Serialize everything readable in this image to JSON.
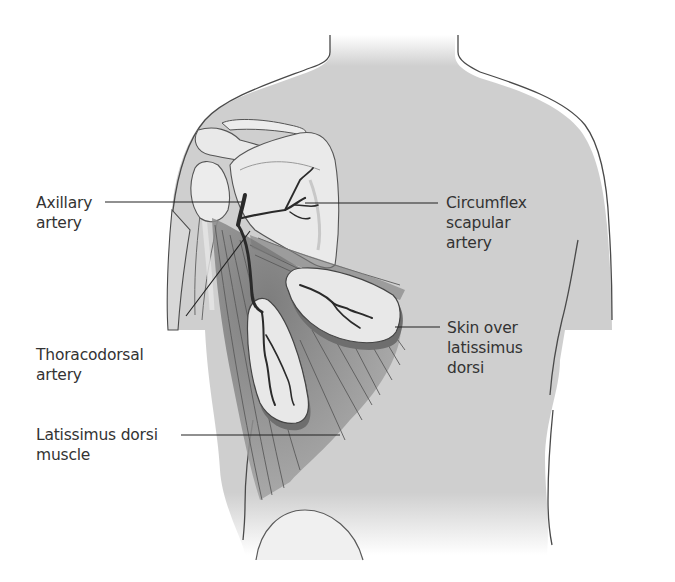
{
  "diagram": {
    "colors": {
      "background": "#ffffff",
      "skin": "#cfcfcf",
      "outline": "#4a4a4a",
      "bone": "#e8e8e8",
      "muscle": "#8c8c8c",
      "artery": "#2a2a2a",
      "text": "#333333",
      "leader_line": "#222222"
    },
    "labels": {
      "axillary": {
        "line1": "Axillary",
        "line2": "artery"
      },
      "circumflex": {
        "line1": "Circumflex",
        "line2": "scapular",
        "line3": "artery"
      },
      "skin_over": {
        "line1": "Skin over",
        "line2": "latissimus",
        "line3": "dorsi"
      },
      "thoracodorsal": {
        "line1": "Thoracodorsal",
        "line2": "artery"
      },
      "latissimus": {
        "line1": "Latissimus dorsi",
        "line2": "muscle"
      }
    }
  }
}
